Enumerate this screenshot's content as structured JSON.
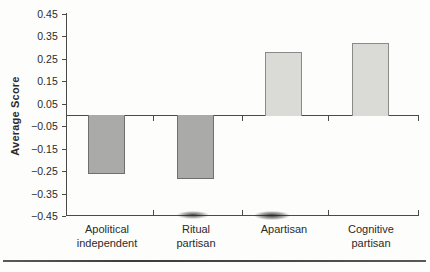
{
  "chart_data": {
    "type": "bar",
    "title": "",
    "xlabel": "",
    "ylabel": "Average Score",
    "categories": [
      "Apolitical independent",
      "Ritual partisan",
      "Apartisan",
      "Cognitive partisan"
    ],
    "category_lines": [
      [
        "Apolitical",
        "independent"
      ],
      [
        "Ritual",
        "partisan"
      ],
      [
        "Apartisan"
      ],
      [
        "Cognitive",
        "partisan"
      ]
    ],
    "values": [
      -0.26,
      -0.28,
      0.28,
      0.32
    ],
    "baseline": 0,
    "ylim": [
      -0.45,
      0.45
    ],
    "ytick_step": 0.1,
    "ytick_labels": [
      "0.45",
      "0.35",
      "0.25",
      "0.15",
      "0.05",
      "−0.05",
      "−0.15",
      "−0.25",
      "−0.35",
      "−0.45"
    ],
    "grid": "off",
    "legend": "none",
    "colors": {
      "negative_bar_fill": "#aaaaa8",
      "negative_bar_border": "#6f6f6d",
      "positive_bar_fill": "#dadad6",
      "positive_bar_border": "#8a8a88",
      "axis": "#4a4a4a",
      "text": "#2b2b2b"
    }
  }
}
